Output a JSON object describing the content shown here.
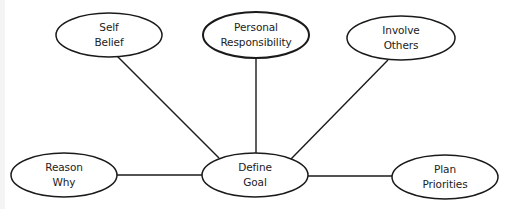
{
  "diagram": {
    "type": "mind-map",
    "colors": {
      "background": "#ffffff",
      "stroke": "#1a1a1a",
      "text": "#222222"
    },
    "center_node": {
      "id": "define-goal",
      "line1": "Define",
      "line2": "Goal",
      "cx": 255,
      "cy": 175,
      "rx": 53,
      "ry": 22
    },
    "nodes": [
      {
        "id": "self-belief",
        "line1": "Self",
        "line2": "Belief",
        "cx": 109,
        "cy": 35,
        "rx": 53,
        "ry": 22
      },
      {
        "id": "personal-responsibility",
        "line1": "Personal",
        "line2": "Responsibility",
        "cx": 256,
        "cy": 35,
        "rx": 53,
        "ry": 23
      },
      {
        "id": "involve-others",
        "line1": "Involve",
        "line2": "Others",
        "cx": 401,
        "cy": 38,
        "rx": 54,
        "ry": 22
      },
      {
        "id": "reason-why",
        "line1": "Reason",
        "line2": "Why",
        "cx": 64,
        "cy": 175,
        "rx": 53,
        "ry": 22
      },
      {
        "id": "plan-priorities",
        "line1": "Plan",
        "line2": "Priorities",
        "cx": 445,
        "cy": 177,
        "rx": 53,
        "ry": 22
      }
    ],
    "edges": [
      {
        "from": "self-belief",
        "to": "define-goal",
        "x1": 117,
        "y1": 56,
        "x2": 219,
        "y2": 158
      },
      {
        "from": "personal-responsibility",
        "to": "define-goal",
        "x1": 256,
        "y1": 58,
        "x2": 256,
        "y2": 153
      },
      {
        "from": "involve-others",
        "to": "define-goal",
        "x1": 388,
        "y1": 60,
        "x2": 291,
        "y2": 159
      },
      {
        "from": "reason-why",
        "to": "define-goal",
        "x1": 117,
        "y1": 175,
        "x2": 202,
        "y2": 175
      },
      {
        "from": "plan-priorities",
        "to": "define-goal",
        "x1": 308,
        "y1": 176,
        "x2": 392,
        "y2": 176
      }
    ]
  }
}
